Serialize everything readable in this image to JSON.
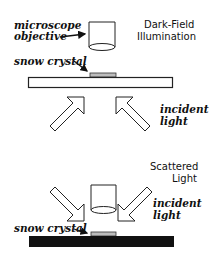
{
  "panels": [
    {
      "title_line1": "Dark-Field",
      "title_line2": "Illumination",
      "objective_label_line1": "microscope",
      "objective_label_line2": "objective",
      "crystal_label": "snow crystal",
      "incident_label_line1": "incident",
      "incident_label_line2": "light",
      "slide_fill": "#ffffff",
      "arrow_direction": "up"
    },
    {
      "title_line1": "Scattered",
      "title_line2": "Light",
      "crystal_label": "snow crystal",
      "incident_label_line1": "incident",
      "incident_label_line2": "light",
      "slide_fill": "#111111",
      "arrow_direction": "down"
    }
  ],
  "colors": {
    "stroke": "#222222",
    "crystal": "#bdbdbd",
    "dark_slide": "#111111"
  }
}
